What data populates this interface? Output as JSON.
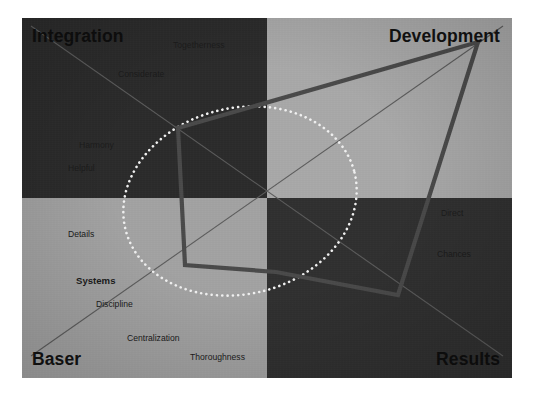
{
  "chart_data": {
    "type": "scatter",
    "title": "",
    "subtitle": "",
    "xlabel": "",
    "ylabel": "",
    "grid": false,
    "legend_position": "none",
    "axis_ranges": {
      "x": [
        -1,
        1
      ],
      "y": [
        -1,
        1
      ]
    },
    "quadrants": [
      {
        "id": "top-left",
        "label": "Integration",
        "fill": "#2b2b2b",
        "label_position": "top-left"
      },
      {
        "id": "top-right",
        "label": "Development",
        "fill": "#a9a9a9",
        "label_position": "top-right"
      },
      {
        "id": "bottom-left",
        "label": "Baser",
        "fill": "#a3a3a3",
        "label_position": "bottom-left"
      },
      {
        "id": "bottom-right",
        "label": "Results",
        "fill": "#303030",
        "label_position": "bottom-right"
      }
    ],
    "traits": [
      {
        "label": "Togetherness",
        "quadrant": "top-left",
        "x": 173,
        "y": 41,
        "emphasis": false
      },
      {
        "label": "Considerate",
        "quadrant": "top-left",
        "x": 118,
        "y": 70,
        "emphasis": false
      },
      {
        "label": "Harmony",
        "quadrant": "top-left",
        "x": 79,
        "y": 141,
        "emphasis": false
      },
      {
        "label": "Helpful",
        "quadrant": "top-left",
        "x": 68,
        "y": 164,
        "emphasis": false
      },
      {
        "label": "Details",
        "quadrant": "bottom-left",
        "x": 68,
        "y": 230,
        "emphasis": false
      },
      {
        "label": "Systems",
        "quadrant": "bottom-left",
        "x": 76,
        "y": 276,
        "emphasis": true
      },
      {
        "label": "Discipline",
        "quadrant": "bottom-left",
        "x": 96,
        "y": 300,
        "emphasis": false
      },
      {
        "label": "Centralization",
        "quadrant": "bottom-left",
        "x": 127,
        "y": 334,
        "emphasis": false
      },
      {
        "label": "Thoroughness",
        "quadrant": "bottom-left",
        "x": 190,
        "y": 353,
        "emphasis": false
      },
      {
        "label": "Direct",
        "quadrant": "bottom-right",
        "x": 441,
        "y": 209,
        "emphasis": false
      },
      {
        "label": "Chances",
        "quadrant": "bottom-right",
        "x": 437,
        "y": 250,
        "emphasis": false
      }
    ],
    "series": [
      {
        "name": "profile-polygon",
        "type": "polygon",
        "color": "#4a4a4a",
        "points": [
          {
            "x": 478,
            "y": 42
          },
          {
            "x": 398,
            "y": 295
          },
          {
            "x": 276,
            "y": 272
          },
          {
            "x": 185,
            "y": 265
          },
          {
            "x": 178,
            "y": 128
          }
        ]
      },
      {
        "name": "norm-ellipse",
        "type": "ellipse",
        "style": "dotted",
        "color": "#f2f2f2",
        "center": {
          "x": 240,
          "y": 201
        },
        "radius_x": 118,
        "radius_y": 93,
        "rotation_deg": -14
      },
      {
        "name": "diagonal-axis-major",
        "type": "line",
        "color": "#5c5c5c",
        "from": {
          "x": 31,
          "y": 356
        },
        "to": {
          "x": 503,
          "y": 26
        }
      },
      {
        "name": "diagonal-axis-minor",
        "type": "line",
        "color": "#5c5c5c",
        "from": {
          "x": 31,
          "y": 26
        },
        "to": {
          "x": 503,
          "y": 356
        }
      }
    ],
    "colors": {
      "quadrant_top_left": "#2b2b2b",
      "quadrant_top_right": "#a9a9a9",
      "quadrant_bottom_left": "#a3a3a3",
      "quadrant_bottom_right": "#303030",
      "polygon_stroke": "#4a4a4a",
      "ellipse_stroke": "#f2f2f2",
      "axis_stroke": "#5c5c5c",
      "page_background": "#ffffff"
    }
  }
}
